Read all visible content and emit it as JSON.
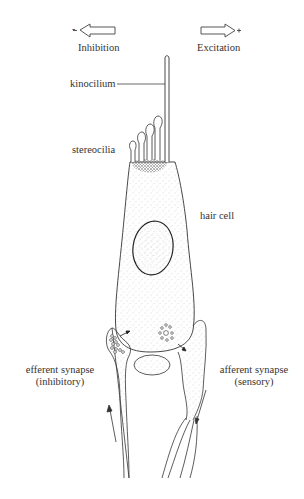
{
  "diagram": {
    "direction_labels": {
      "left": {
        "sign": "-",
        "label": "Inhibition"
      },
      "right": {
        "sign": "+",
        "label": "Excitation"
      }
    },
    "labels": {
      "kinocilium": "kinocilium",
      "stereocilia": "stereocilia",
      "hair_cell": "hair cell",
      "efferent_line1": "efferent synapse",
      "efferent_line2": "(inhibitory)",
      "afferent_line1": "afferent synapse",
      "afferent_line2": "(sensory)"
    },
    "colors": {
      "line": "#333333",
      "stipple": "#9a9a9a",
      "background": "#ffffff"
    }
  }
}
